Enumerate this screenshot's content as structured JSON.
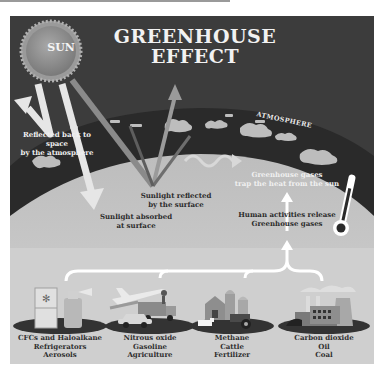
{
  "title": {
    "line1": "GREENHOUSE",
    "line2": "EFFECT"
  },
  "sun": {
    "label": "SUN"
  },
  "atmosphere": {
    "label": "ATMOSPHERE"
  },
  "annotations": {
    "reflected_back": {
      "line1": "Reflected back to space",
      "line2": "by the atmosphere"
    },
    "sunlight_reflected": {
      "line1": "Sunlight reflected",
      "line2": "by the surface"
    },
    "sunlight_absorbed": {
      "line1": "Sunlight absorbed",
      "line2": "at surface"
    },
    "gases_trap": {
      "line1": "Greenhouse gases",
      "line2": "trap the heat from the sun"
    },
    "human_activities": {
      "line1": "Human activities release",
      "line2": "Greenhouse gases"
    }
  },
  "sources": [
    {
      "name": "CFCs and Haloalkane",
      "items": [
        "Refrigerators",
        "Aerosols"
      ],
      "icon": "refrigerator-aerosol-icon"
    },
    {
      "name": "Nitrous oxide",
      "items": [
        "Gasoline",
        "Agriculture"
      ],
      "icon": "vehicles-icon"
    },
    {
      "name": "Methane",
      "items": [
        "Cattle",
        "Fertilizer"
      ],
      "icon": "farm-icon"
    },
    {
      "name": "Carbon dioxide",
      "items": [
        "Oil",
        "Coal"
      ],
      "icon": "factory-icon"
    }
  ],
  "colors": {
    "sky": "#3c3c3c",
    "atmosphere_band": "#2b2b2b",
    "earth_surface": "#c4c4c4",
    "sun": "#8e8e8e",
    "arrows": "#e6e6e6"
  }
}
